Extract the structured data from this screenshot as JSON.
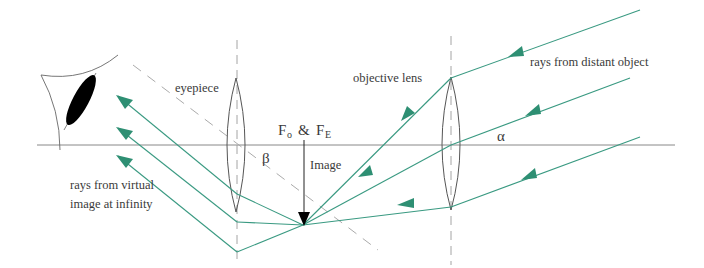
{
  "diagram": {
    "labels": {
      "eyepiece": "eyepiece",
      "objective": "objective lens",
      "rays_distant": "rays from distant object",
      "rays_virtual_line1": "rays from virtual",
      "rays_virtual_line2": "image at infinity",
      "focal_F": "F",
      "focal_sub_o": "o",
      "focal_amp": "&",
      "focal_sub_E": "E",
      "image": "Image",
      "alpha": "α",
      "beta": "β"
    },
    "colors": {
      "ray": "#3a9a82",
      "arrow": "#2e8f73",
      "line": "#6a6a6a",
      "dashed": "#9a9a9a",
      "eye": "#000000"
    },
    "elements": [
      "eye",
      "principal-axis",
      "eyepiece-lens",
      "objective-lens",
      "focal-point-image-arrow",
      "incoming-rays",
      "outgoing-rays"
    ]
  }
}
